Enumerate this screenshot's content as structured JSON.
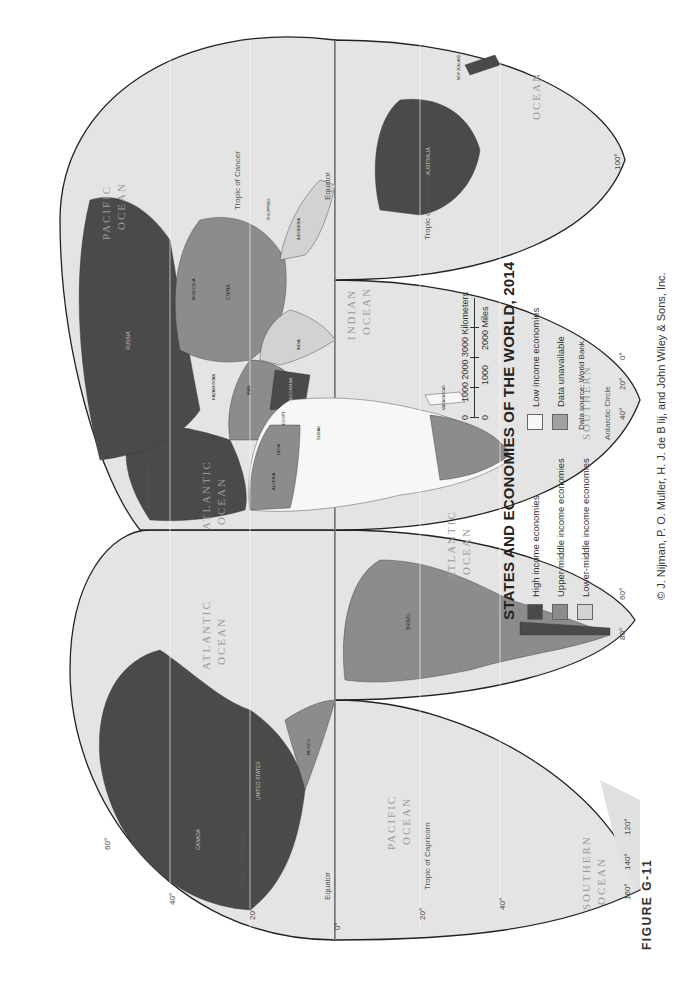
{
  "figure_label": "FIGURE G-11",
  "legend": {
    "title": "STATES AND ECONOMIES OF THE WORLD, 2014",
    "items": [
      {
        "label": "High income economies",
        "color": "#4a4a4a"
      },
      {
        "label": "Low income economies",
        "color": "#f7f7f7"
      },
      {
        "label": "Upper-middle income economies",
        "color": "#8c8c8c"
      },
      {
        "label": "Data unavailable",
        "color": "#a0a0a0"
      },
      {
        "label": "Lower-middle income economies",
        "color": "#d2d2d2"
      }
    ],
    "source": "Data source: World Bank."
  },
  "scale": {
    "km_label": "1000 2000 3000 Kilometers",
    "km_ticks": [
      "0",
      "1000",
      "2000",
      "3000"
    ],
    "mi_label": "2000 Miles",
    "mi_ticks": [
      "0",
      "1000",
      "2000"
    ],
    "km_unit": "Kilometers",
    "mi_unit": "Miles"
  },
  "copyright": "© J. Nijman, P. O. Muller, H. J. de B lij, and John Wiley & Sons, Inc.",
  "map": {
    "ocean_color": "#e4e4e4",
    "land_colors": {
      "high": "#4a4a4a",
      "upper_middle": "#8c8c8c",
      "lower_middle": "#d2d2d2",
      "low": "#f7f7f7",
      "unavailable": "#a0a0a0"
    },
    "oceans": [
      {
        "name": "PACIFIC",
        "name2": "OCEAN"
      },
      {
        "name": "ATLANTIC",
        "name2": "OCEAN"
      },
      {
        "name": "ATLANTIC",
        "name2": "OCEAN"
      },
      {
        "name": "ATLANTIC",
        "name2": "OCEAN"
      },
      {
        "name": "INDIAN",
        "name2": "OCEAN"
      },
      {
        "name": "PACIFIC",
        "name2": "OCEAN"
      },
      {
        "name": "OCEAN"
      },
      {
        "name": "SOUTHERN",
        "name2": "OCEAN"
      },
      {
        "name": "SOUTHERN"
      }
    ],
    "lines": {
      "tropic_cancer": "Tropic of Cancer",
      "tropic_capricorn": "Tropic of Capricorn",
      "equator": "Equator",
      "arctic_circle": "Arctic Circle",
      "antarctic_circle": "Antarctic Circle"
    },
    "countries": {
      "canada": "CANADA",
      "usa": "UNITED STATES",
      "mexico": "MEXICO",
      "brazil": "BRAZIL",
      "russia": "RUSSIA",
      "china": "CHINA",
      "india": "INDIA",
      "australia": "AUSTRALIA",
      "indonesia": "INDONESIA",
      "philippines": "PHILIPPINES",
      "algeria": "ALGERIA",
      "libya": "LIBYA",
      "egypt": "EGYPT",
      "sudan": "SUDAN",
      "saudi_arabia": "SAUDI ARABIA",
      "iran": "IRAN",
      "kazakhstan": "KAZAKHSTAN",
      "mongolia": "MONGOLIA",
      "madagascar": "MADAGASCAR",
      "new_zealand": "NEW ZEALAND"
    },
    "lat_labels": [
      "0°",
      "20°",
      "40°",
      "60°",
      "20°",
      "40°"
    ],
    "lon_labels": [
      "160°",
      "140°",
      "120°",
      "100°",
      "80°",
      "60°",
      "40°",
      "20°",
      "0°"
    ]
  }
}
